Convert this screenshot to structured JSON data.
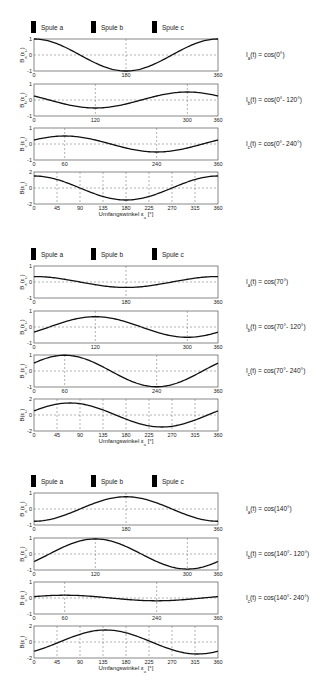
{
  "chart_data": [
    {
      "type": "line",
      "title": "",
      "time_angle_deg": 0,
      "legend": [
        "Spule a",
        "Spule b",
        "Spule c"
      ],
      "legend_placement": "top",
      "xlabel": "Umfangswinkel ε_u [°]",
      "xlim": [
        0,
        360
      ],
      "subplots": [
        {
          "ylabel": "B_a(ε_u)",
          "formula": "I_a(t) = cos(0°)",
          "amplitude": 1.0,
          "phase_deg": 0,
          "ylim": [
            -1,
            1
          ],
          "yticks": [
            "1",
            "0",
            "-1"
          ],
          "xticks": [
            "0",
            "180",
            "360"
          ]
        },
        {
          "ylabel": "B_b(ε_u)",
          "formula": "I_b(t) = cos(0°- 120°)",
          "amplitude": -0.5,
          "phase_deg": 120,
          "ylim": [
            -1,
            1
          ],
          "yticks": [
            "1",
            "0",
            "-1"
          ],
          "xticks": [
            "0",
            "120",
            "300",
            "360"
          ]
        },
        {
          "ylabel": "B_c(ε_u)",
          "formula": "I_c(t) = cos(0°- 240°)",
          "amplitude": -0.5,
          "phase_deg": 240,
          "ylim": [
            -1,
            1
          ],
          "yticks": [
            "1",
            "0",
            "-1"
          ],
          "xticks": [
            "0",
            "60",
            "240",
            "360"
          ]
        },
        {
          "ylabel": "B(ε_u)",
          "formula": "",
          "amplitude": 1.5,
          "phase_deg": 0,
          "ylim": [
            -2,
            2
          ],
          "yticks": [
            "2",
            "0",
            "-2"
          ],
          "xticks": [
            "0",
            "45",
            "90",
            "135",
            "180",
            "225",
            "270",
            "315",
            "360"
          ]
        }
      ]
    },
    {
      "type": "line",
      "title": "",
      "time_angle_deg": 70,
      "legend": [
        "Spule a",
        "Spule b",
        "Spule c"
      ],
      "legend_placement": "top",
      "xlabel": "Umfangswinkel ε_u [°]",
      "xlim": [
        0,
        360
      ],
      "subplots": [
        {
          "ylabel": "B_a(ε_u)",
          "formula": "I_a(t) = cos(70°)",
          "amplitude": 0.342,
          "phase_deg": 0,
          "ylim": [
            -1,
            1
          ],
          "yticks": [
            "1",
            "0",
            "-1"
          ],
          "xticks": [
            "0",
            "180",
            "360"
          ]
        },
        {
          "ylabel": "B_b(ε_u)",
          "formula": "I_b(t) = cos(70°- 120°)",
          "amplitude": 0.643,
          "phase_deg": 120,
          "ylim": [
            -1,
            1
          ],
          "yticks": [
            "1",
            "0",
            "-1"
          ],
          "xticks": [
            "0",
            "120",
            "300",
            "360"
          ]
        },
        {
          "ylabel": "B_c(ε_u)",
          "formula": "I_c(t) = cos(70°- 240°)",
          "amplitude": -0.985,
          "phase_deg": 240,
          "ylim": [
            -1,
            1
          ],
          "yticks": [
            "1",
            "0",
            "-1"
          ],
          "xticks": [
            "0",
            "60",
            "240",
            "360"
          ]
        },
        {
          "ylabel": "B(ε_u)",
          "formula": "",
          "amplitude": 1.5,
          "phase_deg": 70,
          "ylim": [
            -2,
            2
          ],
          "yticks": [
            "2",
            "0",
            "-2"
          ],
          "xticks": [
            "0",
            "45",
            "90",
            "135",
            "180",
            "225",
            "270",
            "315",
            "360"
          ]
        }
      ]
    },
    {
      "type": "line",
      "title": "",
      "time_angle_deg": 140,
      "legend": [
        "Spule a",
        "Spule b",
        "Spule c"
      ],
      "legend_placement": "top",
      "xlabel": "Umfangswinkel ε_u [°]",
      "xlim": [
        0,
        360
      ],
      "subplots": [
        {
          "ylabel": "B_a(ε_u)",
          "formula": "I_a(t) = cos(140°)",
          "amplitude": -0.766,
          "phase_deg": 0,
          "ylim": [
            -1,
            1
          ],
          "yticks": [
            "1",
            "0",
            "-1"
          ],
          "xticks": [
            "0",
            "180",
            "360"
          ]
        },
        {
          "ylabel": "B_b(ε_u)",
          "formula": "I_b(t) = cos(140°- 120°)",
          "amplitude": 0.94,
          "phase_deg": 120,
          "ylim": [
            -1,
            1
          ],
          "yticks": [
            "1",
            "0",
            "-1"
          ],
          "xticks": [
            "0",
            "120",
            "300",
            "360"
          ]
        },
        {
          "ylabel": "B_c(ε_u)",
          "formula": "I_c(t) = cos(140°- 240°)",
          "amplitude": -0.174,
          "phase_deg": 240,
          "ylim": [
            -1,
            1
          ],
          "yticks": [
            "1",
            "0",
            "-1"
          ],
          "xticks": [
            "0",
            "60",
            "240",
            "360"
          ]
        },
        {
          "ylabel": "B(ε_u)",
          "formula": "",
          "amplitude": 1.5,
          "phase_deg": 140,
          "ylim": [
            -2,
            2
          ],
          "yticks": [
            "2",
            "0",
            "-2"
          ],
          "xticks": [
            "0",
            "45",
            "90",
            "135",
            "180",
            "225",
            "270",
            "315",
            "360"
          ]
        }
      ]
    }
  ],
  "colors": {
    "curve": "#111111",
    "frame": "#555555",
    "grid": "#666666",
    "legend_swatch": "#000000"
  }
}
